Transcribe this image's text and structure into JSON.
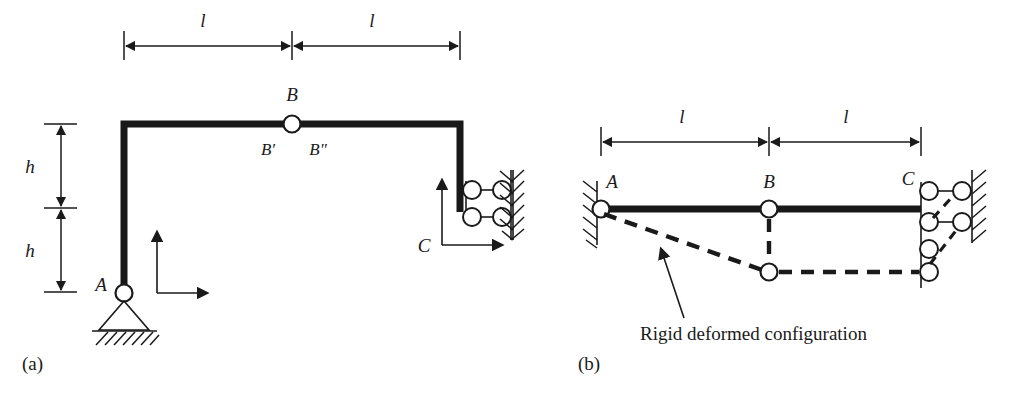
{
  "figure": {
    "type": "structural-engineering-diagram",
    "panels": [
      {
        "id": "a",
        "label": "(a)",
        "title": "Frame with internal hinge at B",
        "dimensions": {
          "horizontal": [
            {
              "label": "l",
              "segment": "left-span"
            },
            {
              "label": "l",
              "segment": "right-span"
            }
          ],
          "vertical": [
            {
              "label": "h",
              "segment": "upper"
            },
            {
              "label": "h",
              "segment": "lower"
            }
          ]
        },
        "nodes": [
          {
            "name": "A",
            "label": "A",
            "support": "pin"
          },
          {
            "name": "B",
            "label": "B",
            "support": "internal-hinge"
          },
          {
            "name": "Bprime",
            "label": "B′",
            "support": "none"
          },
          {
            "name": "Bdoubleprime",
            "label": "B″",
            "support": "none"
          },
          {
            "name": "C",
            "label": "C",
            "support": "double-roller-wall"
          }
        ],
        "axes": {
          "vertical_arrow": "up",
          "horizontal_arrow": "right"
        }
      },
      {
        "id": "b",
        "label": "(b)",
        "title": "Rigid deformed configuration",
        "dimensions": {
          "horizontal": [
            {
              "label": "l",
              "segment": "left-span"
            },
            {
              "label": "l",
              "segment": "right-span"
            }
          ]
        },
        "nodes": [
          {
            "name": "A",
            "label": "A",
            "support": "pin-wall"
          },
          {
            "name": "B",
            "label": "B",
            "support": "internal-hinge"
          },
          {
            "name": "C",
            "label": "C",
            "support": "double-roller-wall"
          }
        ],
        "annotation": {
          "text": "Rigid deformed configuration",
          "points_to": "deformed-member-AB"
        }
      }
    ]
  },
  "colors": {
    "ink": "#1a1a1a",
    "member": "#181818",
    "background": "#ffffff"
  }
}
